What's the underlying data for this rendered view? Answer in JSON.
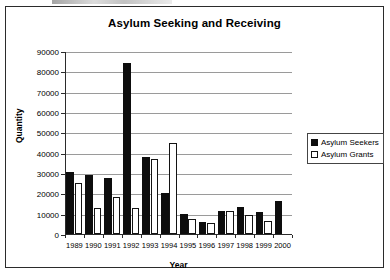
{
  "chart_data": {
    "type": "bar",
    "title": "Asylum Seeking and Receiving",
    "xlabel": "Year",
    "ylabel": "Quantity",
    "categories": [
      "1989",
      "1990",
      "1991",
      "1992",
      "1993",
      "1994",
      "1995",
      "1996",
      "1997",
      "1998",
      "1999",
      "2000"
    ],
    "series": [
      {
        "name": "Asylum Seekers",
        "color": "#0d0d0d",
        "fill": "solid-black",
        "values": [
          30500,
          29000,
          27500,
          84000,
          38000,
          20000,
          10000,
          6000,
          11500,
          13500,
          11000,
          16000
        ]
      },
      {
        "name": "Asylum Grants",
        "color": "#ffffff",
        "fill": "white-outlined",
        "values": [
          25000,
          13000,
          18000,
          13000,
          37000,
          45000,
          7500,
          5500,
          11500,
          9500,
          6500,
          0
        ]
      }
    ],
    "ylim": [
      0,
      90000
    ],
    "ytick_values": [
      0,
      10000,
      20000,
      30000,
      40000,
      50000,
      60000,
      70000,
      80000,
      90000
    ],
    "ytick_labels": [
      "0",
      "10000",
      "20000",
      "30000",
      "40000",
      "50000",
      "60000",
      "70000",
      "80000",
      "90000"
    ],
    "grid": true,
    "grid_axis": "y",
    "legend_position": "right"
  },
  "legend": {
    "entries": [
      {
        "label": "Asylum Seekers",
        "swatch": "filled-black-square"
      },
      {
        "label": "Asylum Grants",
        "swatch": "outlined-white-square"
      }
    ]
  }
}
